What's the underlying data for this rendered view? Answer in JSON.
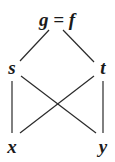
{
  "diagram": {
    "type": "lattice",
    "nodes": [
      {
        "id": "top",
        "label": "g = f",
        "x": 57,
        "y": 26
      },
      {
        "id": "s",
        "label": "s",
        "x": 12,
        "y": 74
      },
      {
        "id": "t",
        "label": "t",
        "x": 103,
        "y": 74
      },
      {
        "id": "x",
        "label": "x",
        "x": 12,
        "y": 153
      },
      {
        "id": "y",
        "label": "y",
        "x": 103,
        "y": 153
      }
    ],
    "edges": [
      {
        "from": "top",
        "to": "s"
      },
      {
        "from": "top",
        "to": "t"
      },
      {
        "from": "s",
        "to": "x"
      },
      {
        "from": "s",
        "to": "y"
      },
      {
        "from": "t",
        "to": "x"
      },
      {
        "from": "t",
        "to": "y"
      }
    ]
  }
}
